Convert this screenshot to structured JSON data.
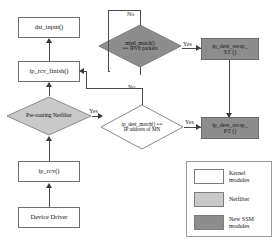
{
  "diagram": {
    "nodes": {
      "dst_input": {
        "label": "dst_input()",
        "kind": "kernel"
      },
      "ip_rcv_finish": {
        "label": "ip_rcv_finish()",
        "kind": "kernel"
      },
      "prerouting_netfilter": {
        "label": "Pre-routing Netfilter",
        "kind": "netfilter"
      },
      "ip_rcv": {
        "label": "ip_rcv()",
        "kind": "kernel"
      },
      "device_driver": {
        "label": "Device Driver",
        "kind": "kernel"
      },
      "mip6_match": {
        "label": "mip6_match()\n== IPV6 packets",
        "kind": "netfilter"
      },
      "ip_dest_match": {
        "label": "ip_dest_match() ==\nIP address of MN",
        "kind": "kernel"
      },
      "ip_dest_swap_st": {
        "label": "ip_dest_swap_\nST ()",
        "kind": "ssm"
      },
      "ip_dest_swap_pt": {
        "label": "ip_dest_swap_\nPT ()",
        "kind": "ssm"
      }
    },
    "edge_labels": {
      "mip6_no": "No",
      "mip6_yes": "Yes",
      "dest_match_no": "No",
      "dest_match_yes": "Yes",
      "netfilter_yes": "Yes"
    },
    "legend": {
      "items": [
        {
          "swatch": "kernel",
          "label": "Kernel\nmodules",
          "color": "#ffffff"
        },
        {
          "swatch": "netfilter",
          "label": "Netfilter",
          "color": "#c9c9c9"
        },
        {
          "swatch": "ssm",
          "label": "New SSM\nmodules",
          "color": "#8d8d8d"
        }
      ]
    },
    "colors": {
      "kernel": "#ffffff",
      "netfilter": "#c9c9c9",
      "ssm": "#8d8d8d",
      "stroke": "#6f6f6f",
      "connector": "#4a4a4a"
    }
  }
}
